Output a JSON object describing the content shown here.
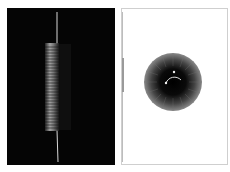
{
  "spread": {
    "left_page": {
      "subject": "vertical coiled spring on black background",
      "background": "#050505",
      "wire_color": "#d8d8d8",
      "coil_color": "#9a9a9a"
    },
    "right_page": {
      "subject": "radial dotted sphere with small arc and two dots",
      "background": "#ffffff",
      "border_color": "#cfcfcf",
      "sphere_outer_color": "#8a8a8a",
      "sphere_core_color": "#050505",
      "arc_color": "#e0e0e0"
    }
  }
}
